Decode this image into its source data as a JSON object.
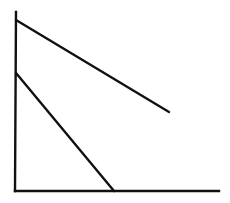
{
  "diagram": {
    "type": "line-graph-sketch",
    "stroke_color": "#111111",
    "background": "#ffffff",
    "axes": {
      "y_axis": {
        "x1": 16,
        "y1": 12,
        "x2": 15,
        "y2": 191
      },
      "x_axis": {
        "x1": 15,
        "y1": 191,
        "x2": 219,
        "y2": 191
      }
    },
    "lines": [
      {
        "name": "upper-line",
        "x1": 16,
        "y1": 20,
        "x2": 169,
        "y2": 112
      },
      {
        "name": "lower-line",
        "x1": 16,
        "y1": 73,
        "x2": 114,
        "y2": 191
      }
    ]
  }
}
